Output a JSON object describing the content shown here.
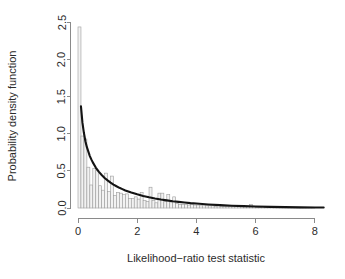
{
  "chart_data": {
    "type": "bar",
    "title": "",
    "subtitle": "",
    "xlabel": "Likelihood−ratio test statistic",
    "ylabel": "Probability density function",
    "xlim": [
      0,
      8.3
    ],
    "ylim": [
      0.0,
      2.5
    ],
    "xticks": [
      0,
      2,
      4,
      6,
      8
    ],
    "xticklabels": [
      "0",
      "2",
      "4",
      "6",
      "8"
    ],
    "yticks": [
      0.0,
      0.5,
      1.0,
      1.5,
      2.0,
      2.5
    ],
    "yticklabels": [
      "0.0",
      "0.5",
      "1.0",
      "1.5",
      "2.0",
      "2.5"
    ],
    "grid": false,
    "legend": null,
    "bin_width": 0.1,
    "categories": [
      0.05,
      0.15,
      0.25,
      0.35,
      0.45,
      0.55,
      0.65,
      0.75,
      0.85,
      0.95,
      1.05,
      1.15,
      1.25,
      1.35,
      1.45,
      1.55,
      1.65,
      1.75,
      1.85,
      1.95,
      2.05,
      2.15,
      2.25,
      2.35,
      2.45,
      2.55,
      2.65,
      2.75,
      2.85,
      2.95,
      3.05,
      3.15,
      3.25,
      3.35,
      3.45,
      3.55,
      3.65,
      3.75,
      3.85,
      3.95,
      4.05,
      4.15,
      4.25,
      4.35,
      4.45,
      4.55,
      4.65,
      4.75,
      4.85,
      4.95,
      5.05,
      5.15,
      5.25,
      5.35,
      5.45,
      5.55,
      5.65,
      5.75,
      5.85,
      5.95,
      6.05,
      6.15,
      6.25,
      6.35,
      6.45,
      6.55,
      6.65,
      6.75,
      6.85,
      6.95,
      7.05,
      7.15,
      7.25,
      7.35,
      7.45,
      7.55,
      7.65,
      7.75,
      7.85,
      7.95
    ],
    "values": [
      2.44,
      0.97,
      0.93,
      0.55,
      0.31,
      0.53,
      0.51,
      0.3,
      0.24,
      0.47,
      0.22,
      0.43,
      0.17,
      0.21,
      0.2,
      0.18,
      0.19,
      0.13,
      0.13,
      0.15,
      0.12,
      0.21,
      0.1,
      0.09,
      0.28,
      0.1,
      0.07,
      0.2,
      0.2,
      0.09,
      0.18,
      0.08,
      0.15,
      0.06,
      0.05,
      0.05,
      0.05,
      0.04,
      0.05,
      0.04,
      0.04,
      0.03,
      0.04,
      0.03,
      0.03,
      0.03,
      0.02,
      0.03,
      0.02,
      0.02,
      0.02,
      0.02,
      0.02,
      0.02,
      0.02,
      0.02,
      0.02,
      0.02,
      0.05,
      0.02,
      0.01,
      0.01,
      0.02,
      0.01,
      0.01,
      0.01,
      0.01,
      0.01,
      0.01,
      0.01,
      0.01,
      0.01,
      0.01,
      0.01,
      0.01,
      0.01,
      0.01,
      0.01,
      0.01,
      0.01
    ],
    "series": [
      {
        "name": "density-curve",
        "type": "line",
        "x": [
          0.1,
          0.15,
          0.2,
          0.25,
          0.3,
          0.35,
          0.4,
          0.45,
          0.5,
          0.6,
          0.7,
          0.8,
          0.9,
          1.0,
          1.1,
          1.2,
          1.3,
          1.4,
          1.5,
          1.6,
          1.8,
          2.0,
          2.2,
          2.4,
          2.6,
          2.8,
          3.0,
          3.2,
          3.4,
          3.6,
          3.8,
          4.0,
          4.4,
          4.8,
          5.2,
          5.6,
          6.0,
          6.5,
          7.0,
          7.5,
          8.0,
          8.3
        ],
        "y": [
          1.37,
          1.15,
          1.01,
          0.9,
          0.82,
          0.76,
          0.7,
          0.655,
          0.615,
          0.545,
          0.49,
          0.445,
          0.405,
          0.372,
          0.342,
          0.316,
          0.293,
          0.272,
          0.254,
          0.237,
          0.208,
          0.184,
          0.163,
          0.145,
          0.129,
          0.115,
          0.103,
          0.092,
          0.083,
          0.074,
          0.066,
          0.06,
          0.048,
          0.039,
          0.031,
          0.025,
          0.02,
          0.015,
          0.012,
          0.009,
          0.007,
          0.006
        ]
      }
    ]
  },
  "colors": {
    "background": "#ffffff",
    "axis": "#8a8a8a",
    "text": "#2b2b2b",
    "bar_fill": "#f2f2f2",
    "bar_stroke": "#9c9c9c",
    "curve": "#141414"
  }
}
